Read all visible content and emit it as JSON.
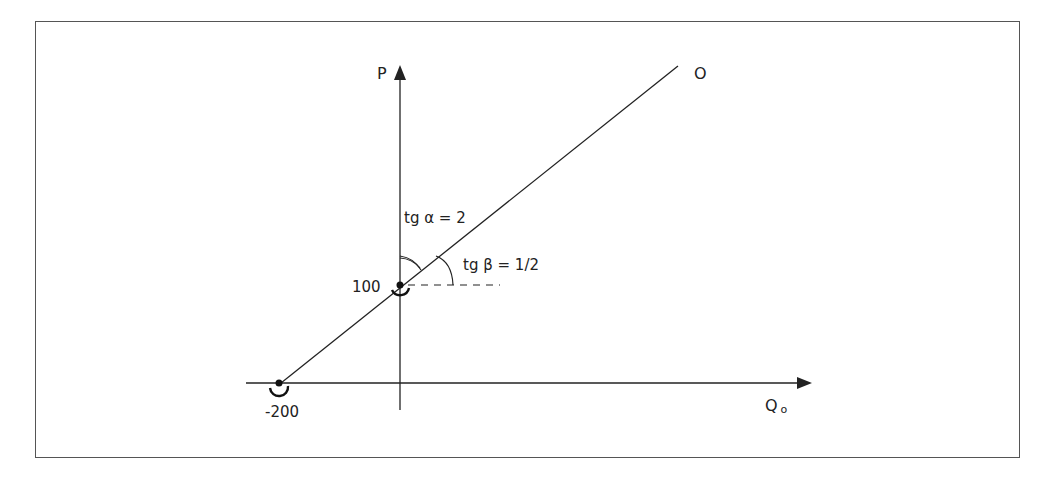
{
  "diagram": {
    "axes": {
      "y_label": "P",
      "x_label": "Q",
      "x_label_subscript": "o"
    },
    "line_label": "O",
    "points": [
      {
        "label": "100",
        "description": "intercept on P axis"
      },
      {
        "label": "-200",
        "description": "intercept on Q axis"
      }
    ],
    "angles": {
      "alpha": "tg α = 2",
      "beta": "tg β = 1/2"
    }
  },
  "colors": {
    "stroke": "#222222",
    "frame": "#555555",
    "background": "#ffffff"
  }
}
